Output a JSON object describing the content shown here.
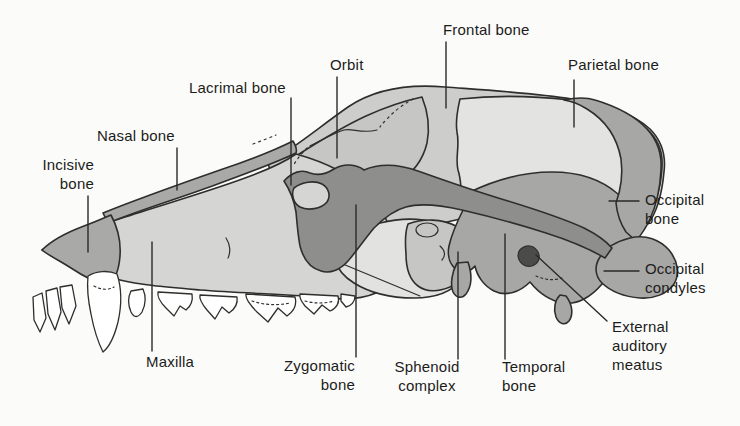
{
  "diagram": {
    "labels": {
      "frontal": "Frontal bone",
      "orbit": "Orbit",
      "parietal": "Parietal bone",
      "lacrimal": "Lacrimal bone",
      "nasal": "Nasal bone",
      "incisive": "Incisive bone",
      "occipital_bone": "Occipital bone",
      "occipital_condyles": "Occipital condyles",
      "external_auditory_meatus": "External auditory meatus",
      "maxilla": "Maxilla",
      "zygomatic": "Zygomatic bone",
      "sphenoid": "Sphenoid complex",
      "temporal": "Temporal bone"
    },
    "colors": {
      "background": "#fbfbf9",
      "outline": "#2e2e2c",
      "bone_light": "#e3e3e1",
      "bone_midlight": "#cdcdcb",
      "bone_mid": "#c6c6c4",
      "maxilla_tone": "#d5d5d3",
      "window_light": "#e2e2e0",
      "bone_dark": "#a7a7a5",
      "zygomatic_dark": "#8e8e8c",
      "nasal_dark": "#a9a9a7",
      "meatus_dark": "#4b4b49",
      "teeth": "#ffffff",
      "label_text": "#1c1c1c"
    }
  }
}
